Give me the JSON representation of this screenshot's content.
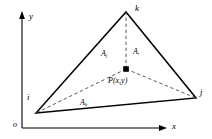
{
  "figure": {
    "type": "geometry-diagram",
    "background_color": "#ffffff",
    "line_color": "#000000",
    "dashed_color": "#555555",
    "axes": {
      "origin_label": "o",
      "x_label": "x",
      "y_label": "y"
    },
    "vertices": [
      {
        "id": "i",
        "label": "i",
        "x": 36,
        "y": 113
      },
      {
        "id": "j",
        "label": "j",
        "x": 196,
        "y": 98
      },
      {
        "id": "k",
        "label": "k",
        "x": 126,
        "y": 12
      }
    ],
    "point": {
      "label": "P(x,y)",
      "x": 126,
      "y": 69,
      "marker": "filled-square"
    },
    "areas": [
      {
        "id": "A_j",
        "base": "A",
        "subscript": "j",
        "x": 101,
        "y": 50
      },
      {
        "id": "A_i",
        "base": "A",
        "subscript": "i",
        "x": 133,
        "y": 48
      },
      {
        "id": "A_k",
        "base": "A",
        "subscript": "k",
        "x": 80,
        "y": 99
      }
    ]
  }
}
